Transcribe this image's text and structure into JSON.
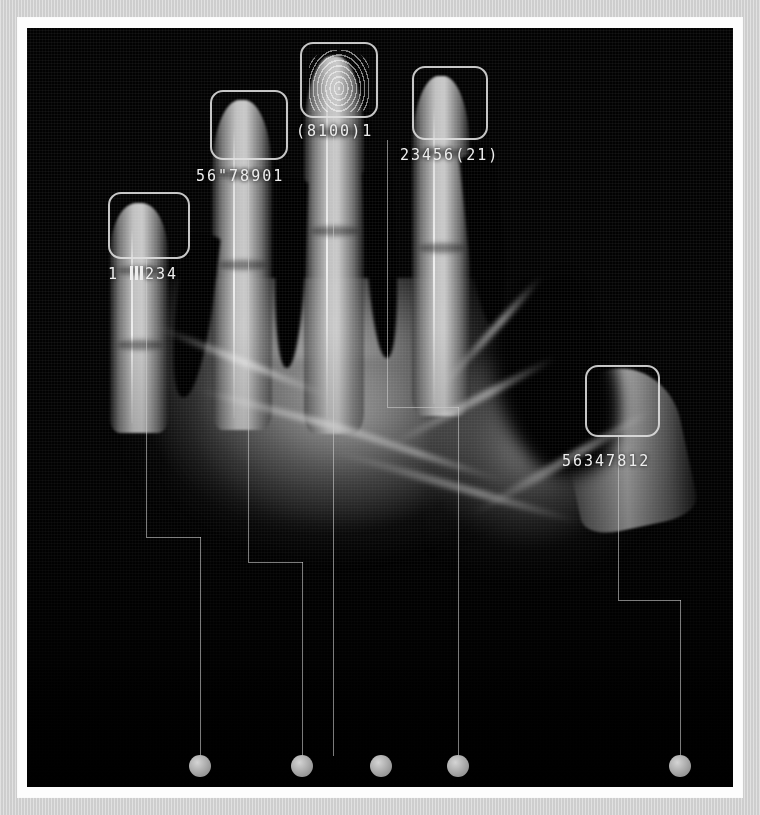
{
  "scan": {
    "modality": "radiograph",
    "subject": "hand",
    "frame_color": "#fdfdfd",
    "mat_color": "#d4d4d4",
    "plate_color": "#020202",
    "annotation_color": "#ededed",
    "node_color": "#a8a8a8",
    "leader_color": "#cdcdcd"
  },
  "captures": [
    {
      "id": "capture-1",
      "digit": "index-finger",
      "label": "1 |||234",
      "label_prefix": "1",
      "label_suffix": "234",
      "has_barcode_strokes": true,
      "barcode_stroke_count": 3,
      "box": {
        "x": 108,
        "y": 192,
        "w": 82,
        "h": 67
      },
      "label_pos": {
        "x": 108,
        "y": 265
      },
      "node_index": 0
    },
    {
      "id": "capture-2",
      "digit": "middle-finger-left",
      "label": "56\"78901",
      "has_barcode_strokes": false,
      "box": {
        "x": 210,
        "y": 90,
        "w": 78,
        "h": 70
      },
      "label_pos": {
        "x": 196,
        "y": 167
      },
      "node_index": 1
    },
    {
      "id": "capture-3",
      "digit": "middle-finger",
      "label": "(8100)1",
      "has_barcode_strokes": false,
      "has_ridge_pattern": true,
      "box": {
        "x": 300,
        "y": 42,
        "w": 78,
        "h": 76
      },
      "label_pos": {
        "x": 296,
        "y": 122
      },
      "node_index": 2
    },
    {
      "id": "capture-4",
      "digit": "ring-finger",
      "label": "23456(21)",
      "has_barcode_strokes": false,
      "box": {
        "x": 412,
        "y": 66,
        "w": 76,
        "h": 74
      },
      "label_pos": {
        "x": 400,
        "y": 146
      },
      "node_index": 3
    },
    {
      "id": "capture-5",
      "digit": "thumb",
      "label": "56347812",
      "has_barcode_strokes": false,
      "box": {
        "x": 585,
        "y": 365,
        "w": 75,
        "h": 72
      },
      "label_pos": {
        "x": 562,
        "y": 452
      },
      "node_index": 4
    }
  ],
  "nodes": [
    {
      "id": "node-1",
      "x": 200,
      "y": 766
    },
    {
      "id": "node-2",
      "x": 302,
      "y": 766
    },
    {
      "id": "node-3",
      "x": 381,
      "y": 766
    },
    {
      "id": "node-4",
      "x": 458,
      "y": 766
    },
    {
      "id": "node-5",
      "x": 680,
      "y": 766
    }
  ],
  "leaders": [
    {
      "id": "leader-1",
      "segments": [
        {
          "o": "v",
          "x": 146,
          "y": 259,
          "len": 278
        },
        {
          "o": "h",
          "x": 146,
          "y": 537,
          "len": 55
        },
        {
          "o": "v",
          "x": 200,
          "y": 537,
          "len": 219
        }
      ]
    },
    {
      "id": "leader-2",
      "segments": [
        {
          "o": "v",
          "x": 248,
          "y": 160,
          "len": 402
        },
        {
          "o": "h",
          "x": 248,
          "y": 562,
          "len": 55
        },
        {
          "o": "v",
          "x": 302,
          "y": 562,
          "len": 194
        }
      ]
    },
    {
      "id": "leader-3",
      "segments": [
        {
          "o": "v",
          "x": 333,
          "y": 118,
          "len": 638
        }
      ]
    },
    {
      "id": "leader-4",
      "segments": [
        {
          "o": "v",
          "x": 387,
          "y": 140,
          "len": 267
        },
        {
          "o": "h",
          "x": 387,
          "y": 407,
          "len": 72
        },
        {
          "o": "v",
          "x": 458,
          "y": 407,
          "len": 349
        }
      ]
    },
    {
      "id": "leader-5",
      "segments": [
        {
          "o": "v",
          "x": 618,
          "y": 437,
          "len": 163
        },
        {
          "o": "h",
          "x": 618,
          "y": 600,
          "len": 63
        },
        {
          "o": "v",
          "x": 680,
          "y": 600,
          "len": 156
        }
      ]
    }
  ]
}
